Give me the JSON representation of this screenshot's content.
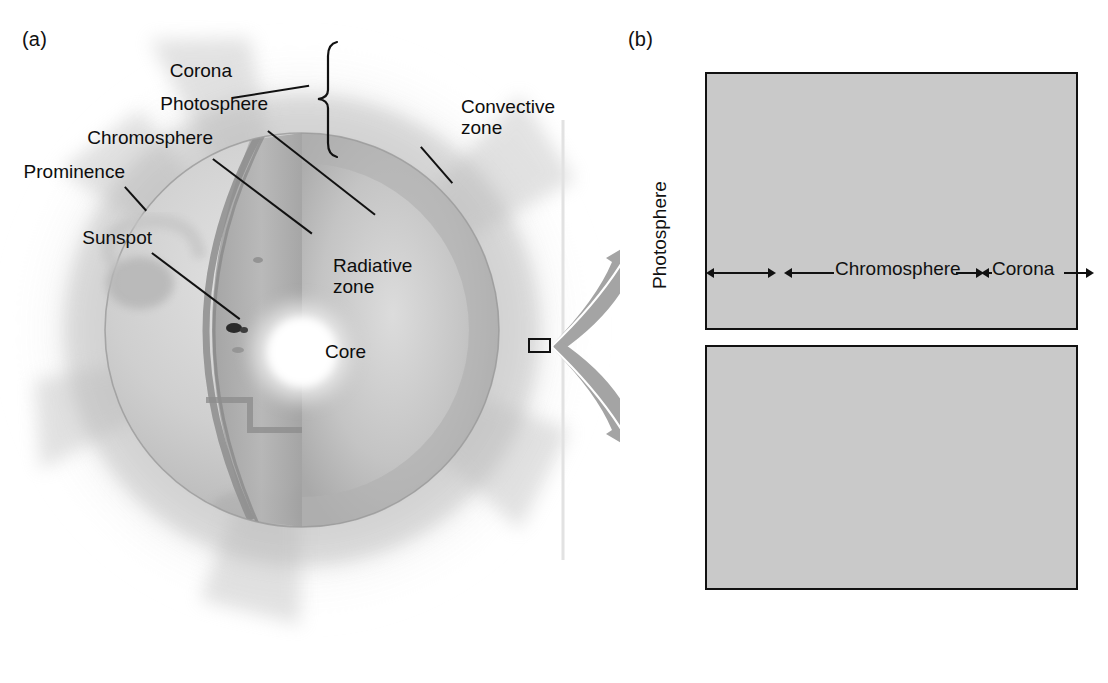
{
  "figure": {
    "panel_a_tag": "(a)",
    "panel_b_tag": "(b)"
  },
  "diagram": {
    "labels": {
      "corona": "Corona",
      "photosphere": "Photosphere",
      "chromosphere": "Chromosphere",
      "prominence": "Prominence",
      "sunspot": "Sunspot",
      "convective_zone_l1": "Convective",
      "convective_zone_l2": "zone",
      "radiative_zone_l1": "Radiative",
      "radiative_zone_l2": "zone",
      "core": "Core"
    }
  },
  "chart_data": [
    {
      "type": "line",
      "id": "density",
      "title": "",
      "xlabel": "Height (km)",
      "ylabel": "Density (kg/m³)",
      "xlim": [
        -120,
        3480
      ],
      "ylim": [
        1e-12,
        0.003
      ],
      "yscale": "log",
      "grid": true,
      "legend": "none",
      "xticks": [
        0,
        1000,
        2000,
        3000
      ],
      "xticklabels": [
        "0",
        "1,000",
        "2,000",
        "3,000"
      ],
      "yticks": [
        0.001,
        1e-05,
        1e-07,
        1e-09,
        1e-11
      ],
      "yticklabels": [
        "10−3",
        "10−5",
        "10−7",
        "10−9",
        "10−11"
      ],
      "regions": [
        {
          "name": "Photosphere",
          "x0": -120,
          "x1": 500,
          "shade": "#d8d8d8"
        },
        {
          "name": "Chromosphere",
          "x0": 500,
          "x1": 2130,
          "shade": "#c3c3c3"
        },
        {
          "name": "Corona",
          "x0": 2130,
          "x1": 3480,
          "shade": "#ababab"
        }
      ],
      "x": [
        0,
        80,
        160,
        240,
        330,
        430,
        530,
        650,
        780,
        920,
        1070,
        1230,
        1400,
        1580,
        1760,
        1930,
        2060,
        2120,
        2160,
        2200,
        2260,
        2360,
        2520,
        2750,
        3050,
        3400
      ],
      "y": [
        0.0004,
        0.00033,
        0.0002,
        8e-05,
        2.5e-05,
        7e-06,
        2e-06,
        5.5e-07,
        1.8e-07,
        6e-08,
        2.2e-08,
        8.5e-09,
        3.6e-09,
        1.7e-09,
        9e-10,
        5.2e-10,
        4e-10,
        3.4e-10,
        1.6e-10,
        4.5e-11,
        1.6e-11,
        9e-12,
        6.5e-12,
        5.2e-12,
        4.3e-12,
        3.8e-12
      ]
    },
    {
      "type": "line",
      "id": "temperature",
      "title": "",
      "xlabel": "Height (km)",
      "ylabel": "Temperature (K)",
      "xlim": [
        -120,
        3480
      ],
      "ylim": [
        1000,
        1000000
      ],
      "yscale": "log",
      "grid": true,
      "legend": "none",
      "xticks": [
        0,
        1000,
        2000,
        3000
      ],
      "xticklabels": [
        "0",
        "1,000",
        "2,000",
        "3,000"
      ],
      "yticks": [
        1000000,
        100000,
        10000,
        1000
      ],
      "yticklabels": [
        "10⁶",
        "10⁵",
        "10⁴",
        "10³"
      ],
      "regions": [
        {
          "name": "Photosphere",
          "x0": -120,
          "x1": 500,
          "shade": "#d8d8d8"
        },
        {
          "name": "Chromosphere",
          "x0": 500,
          "x1": 2130,
          "shade": "#c3c3c3"
        },
        {
          "name": "Corona",
          "x0": 2130,
          "x1": 3480,
          "shade": "#ababab"
        }
      ],
      "x": [
        -110,
        -40,
        40,
        130,
        240,
        350,
        460,
        530,
        600,
        680,
        790,
        920,
        1080,
        1280,
        1500,
        1720,
        1900,
        2020,
        2090,
        2130,
        2160,
        2190,
        2220,
        2260,
        2320,
        2420,
        2560,
        2760,
        3020,
        3400
      ],
      "y": [
        10500,
        9200,
        7300,
        5900,
        5000,
        4600,
        4400,
        4350,
        4500,
        4900,
        5400,
        5800,
        6100,
        6400,
        6700,
        7000,
        7300,
        7700,
        8200,
        9000,
        12000,
        30000,
        80000,
        160000,
        230000,
        290000,
        350000,
        420000,
        490000,
        570000
      ]
    }
  ],
  "regions_legend": {
    "photosphere": "Photosphere",
    "chromosphere": "Chromosphere",
    "corona": "Corona"
  },
  "colors": {
    "curve": "#6f6f6f",
    "curve_halo": "#ffffff",
    "frame": "#111111",
    "grid": "#5d5d5d",
    "band_photosphere": "#d8d8d8",
    "band_chromosphere": "#c3c3c3",
    "band_corona": "#ababab",
    "arrow": "#9a9a9a"
  }
}
